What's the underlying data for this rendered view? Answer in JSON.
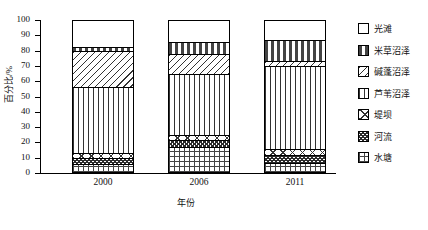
{
  "chart_data": {
    "type": "bar",
    "subtype": "stacked-percentage-column",
    "title": "",
    "xlabel": "年份",
    "ylabel": "百分比/%",
    "categories": [
      "2000",
      "2006",
      "2011"
    ],
    "ylim": [
      0,
      100
    ],
    "ytick_labels": [
      "0",
      "10",
      "20",
      "30",
      "40",
      "50",
      "60",
      "70",
      "80",
      "90",
      "100"
    ],
    "ytick_values": [
      0,
      10,
      20,
      30,
      40,
      50,
      60,
      70,
      80,
      90,
      100
    ],
    "grid": false,
    "legend_position": "right",
    "stack_order_bottom_to_top": [
      "水塘",
      "河流",
      "堤坝",
      "芦苇沼泽",
      "碱蓬沼泽",
      "米草沼泽",
      "光滩"
    ],
    "series": [
      {
        "name": "水塘",
        "pattern": "fine-grid",
        "values": [
          6.0,
          17.0,
          6.5
        ]
      },
      {
        "name": "河流",
        "pattern": "dense-checker",
        "values": [
          4.0,
          4.5,
          5.0
        ]
      },
      {
        "name": "堤坝",
        "pattern": "cross-diagonal",
        "values": [
          3.0,
          3.5,
          4.5
        ]
      },
      {
        "name": "芦苇沼泽",
        "pattern": "vertical-lines",
        "values": [
          43.0,
          40.0,
          54.0
        ]
      },
      {
        "name": "碱蓬沼泽",
        "pattern": "diagonal-hatch",
        "values": [
          24.0,
          13.0,
          3.0
        ]
      },
      {
        "name": "米草沼泽",
        "pattern": "horizontal-dashed",
        "values": [
          2.5,
          7.5,
          14.0
        ]
      },
      {
        "name": "光滩",
        "pattern": "solid-white",
        "values": [
          17.5,
          14.5,
          13.0
        ]
      }
    ]
  },
  "legend": {
    "items": [
      {
        "label": "光滩",
        "swatch": "legend-swatch-guangtan"
      },
      {
        "label": "米草沼泽",
        "swatch": "legend-swatch-micao"
      },
      {
        "label": "碱蓬沼泽",
        "swatch": "legend-swatch-jianpeng"
      },
      {
        "label": "芦苇沼泽",
        "swatch": "legend-swatch-luwei"
      },
      {
        "label": "堤坝",
        "swatch": "legend-swatch-diba"
      },
      {
        "label": "河流",
        "swatch": "legend-swatch-heliu"
      },
      {
        "label": "水塘",
        "swatch": "legend-swatch-shuitang"
      }
    ]
  }
}
